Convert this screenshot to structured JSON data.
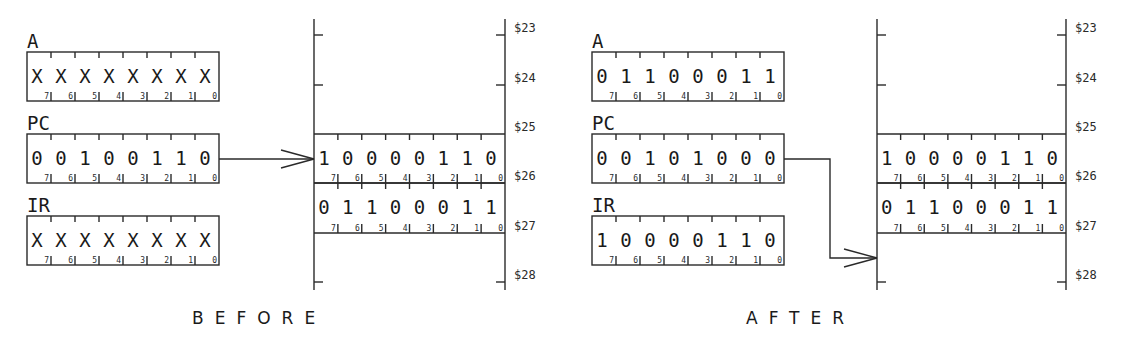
{
  "diagram": {
    "panels": [
      {
        "id": "before",
        "caption": "BEFORE",
        "registers": [
          {
            "name": "A",
            "bits": [
              "X",
              "X",
              "X",
              "X",
              "X",
              "X",
              "X",
              "X"
            ]
          },
          {
            "name": "PC",
            "bits": [
              "0",
              "0",
              "1",
              "0",
              "0",
              "1",
              "1",
              "0"
            ]
          },
          {
            "name": "IR",
            "bits": [
              "X",
              "X",
              "X",
              "X",
              "X",
              "X",
              "X",
              "X"
            ]
          }
        ],
        "memory": {
          "addresses": [
            "$23",
            "$24",
            "$25",
            "$26",
            "$27",
            "$28"
          ],
          "cells": [
            {
              "address": "$25",
              "bits": [
                "1",
                "0",
                "0",
                "0",
                "0",
                "1",
                "1",
                "0"
              ]
            },
            {
              "address": "$26",
              "bits": [
                "0",
                "1",
                "1",
                "0",
                "0",
                "0",
                "1",
                "1"
              ]
            }
          ]
        },
        "arrow": {
          "from": "PC",
          "to": "$25"
        }
      },
      {
        "id": "after",
        "caption": "AFTER",
        "registers": [
          {
            "name": "A",
            "bits": [
              "0",
              "1",
              "1",
              "0",
              "0",
              "0",
              "1",
              "1"
            ]
          },
          {
            "name": "PC",
            "bits": [
              "0",
              "0",
              "1",
              "0",
              "1",
              "0",
              "0",
              "0"
            ]
          },
          {
            "name": "IR",
            "bits": [
              "1",
              "0",
              "0",
              "0",
              "0",
              "1",
              "1",
              "0"
            ]
          }
        ],
        "memory": {
          "addresses": [
            "$23",
            "$24",
            "$25",
            "$26",
            "$27",
            "$28"
          ],
          "cells": [
            {
              "address": "$25",
              "bits": [
                "1",
                "0",
                "0",
                "0",
                "0",
                "1",
                "1",
                "0"
              ]
            },
            {
              "address": "$26",
              "bits": [
                "0",
                "1",
                "1",
                "0",
                "0",
                "0",
                "1",
                "1"
              ]
            }
          ]
        },
        "arrow": {
          "from": "PC",
          "to": "$27"
        }
      }
    ],
    "bit_numbers": [
      "7",
      "6",
      "5",
      "4",
      "3",
      "2",
      "1",
      "0"
    ]
  }
}
